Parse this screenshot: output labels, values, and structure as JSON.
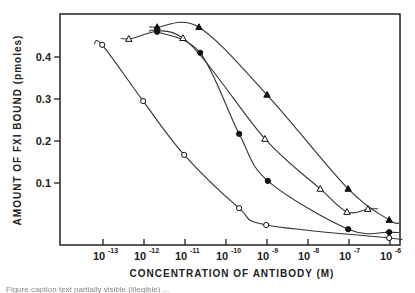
{
  "chart_data": {
    "type": "line",
    "title": "",
    "xlabel": "CONCENTRATION OF ANTIBODY (M)",
    "ylabel": "AMOUNT OF FXI BOUND (pmoles)",
    "xscale": "log10",
    "x_ticks": [
      -13,
      -12,
      -11,
      -10,
      -9,
      -8,
      -7,
      -6
    ],
    "x_tick_labels": [
      "10-13",
      "10-12",
      "10-11",
      "10-10",
      "10-9",
      "10-8",
      "10-7",
      "10-6"
    ],
    "y_ticks": [
      0.1,
      0.2,
      0.3,
      0.4
    ],
    "y_tick_labels": [
      "0.1",
      "0.2",
      "0.3",
      "0.4"
    ],
    "xlim": [
      -13.0,
      -5.7
    ],
    "ylim": [
      -0.05,
      0.5
    ],
    "grid": false,
    "legend": null,
    "series": [
      {
        "name": "filled triangles",
        "marker": "triangle-filled",
        "points": [
          [
            -11.68,
            0.471
          ],
          [
            -10.66,
            0.471
          ],
          [
            -9.0,
            0.31
          ],
          [
            -7.02,
            0.086
          ],
          [
            -6.02,
            0.012
          ]
        ]
      },
      {
        "name": "open triangles",
        "marker": "triangle-open",
        "points": [
          [
            -12.37,
            0.443
          ],
          [
            -11.05,
            0.445
          ],
          [
            -9.05,
            0.205
          ],
          [
            -7.7,
            0.086
          ],
          [
            -7.05,
            0.031
          ],
          [
            -6.54,
            0.038
          ]
        ]
      },
      {
        "name": "filled circles",
        "marker": "circle-filled",
        "points": [
          [
            -11.68,
            0.46
          ],
          [
            -10.63,
            0.41
          ],
          [
            -9.68,
            0.217
          ],
          [
            -8.98,
            0.105
          ],
          [
            -7.02,
            -0.01
          ],
          [
            -6.02,
            -0.017
          ]
        ]
      },
      {
        "name": "open circles",
        "marker": "circle-open",
        "points": [
          [
            -13.02,
            0.429
          ],
          [
            -12.02,
            0.295
          ],
          [
            -11.02,
            0.167
          ],
          [
            -9.68,
            0.04
          ],
          [
            -9.02,
            0.0
          ],
          [
            -6.02,
            -0.031
          ]
        ]
      }
    ]
  },
  "labels": {
    "ylabel": "AMOUNT OF FXI BOUND (pmoles)",
    "xlabel": "CONCENTRATION OF ANTIBODY (M)",
    "x_base": "10",
    "x_exps": [
      "-13",
      "-12",
      "-11",
      "-10",
      "-9",
      "-8",
      "-7",
      "-6"
    ],
    "y_ticks": [
      "0.1",
      "0.2",
      "0.3",
      "0.4"
    ],
    "caption": "Figure caption text partially visible (illegible) ..."
  }
}
